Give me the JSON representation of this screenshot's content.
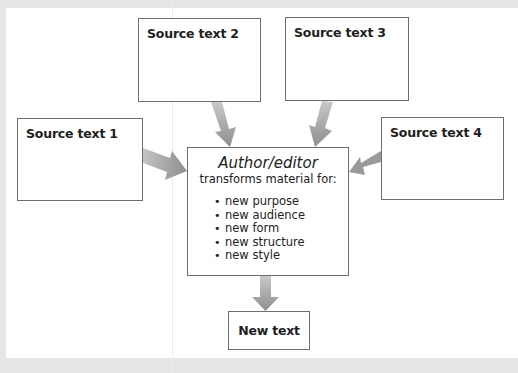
{
  "diagram": {
    "sources": [
      {
        "id": "src1",
        "label": "Source text 1"
      },
      {
        "id": "src2",
        "label": "Source text 2"
      },
      {
        "id": "src3",
        "label": "Source text 3"
      },
      {
        "id": "src4",
        "label": "Source text 4"
      }
    ],
    "center": {
      "heading": "Author/editor",
      "subheading": "transforms material for:",
      "items": [
        "new purpose",
        "new audience",
        "new form",
        "new structure",
        "new style"
      ]
    },
    "output": {
      "label": "New text"
    },
    "edges": [
      {
        "from": "Source text 1",
        "to": "Author/editor"
      },
      {
        "from": "Source text 2",
        "to": "Author/editor"
      },
      {
        "from": "Source text 3",
        "to": "Author/editor"
      },
      {
        "from": "Source text 4",
        "to": "Author/editor"
      },
      {
        "from": "Author/editor",
        "to": "New text"
      }
    ],
    "colors": {
      "background": "#e6e6e6",
      "page": "#ffffff",
      "box_border": "#6e6e6e",
      "arrow": "#9a9a9a",
      "text": "#1e1e1e"
    }
  }
}
